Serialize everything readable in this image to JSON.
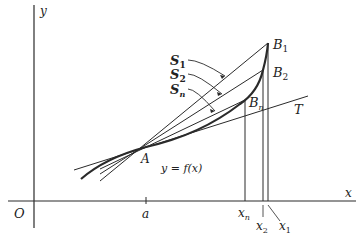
{
  "diagram": {
    "colors": {
      "ink": "#2a2a2a",
      "background": "#ffffff"
    },
    "axes": {
      "x_label": "x",
      "y_label": "y",
      "origin_label": "O"
    },
    "points": {
      "A": "A",
      "B1": "B",
      "B1_sub": "1",
      "B2": "B",
      "B2_sub": "2",
      "Bn": "B",
      "Bn_sub": "n"
    },
    "secants": {
      "S1": "S",
      "S1_sub": "1",
      "S2": "S",
      "S2_sub": "2",
      "Sn": "S",
      "Sn_sub": "n"
    },
    "tangent_label": "T",
    "curve_label": "y = f(x)",
    "x_ticks": {
      "a": "a",
      "xn": "x",
      "xn_sub": "n",
      "x2": "x",
      "x2_sub": "2",
      "x1": "x",
      "x1_sub": "1"
    }
  }
}
